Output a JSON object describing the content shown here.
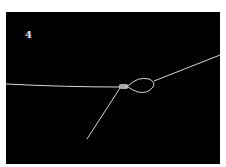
{
  "figure": {
    "step_number": "4",
    "colors": {
      "background": "#000000",
      "line": "#d8d8d8",
      "page": "#ffffff"
    }
  }
}
